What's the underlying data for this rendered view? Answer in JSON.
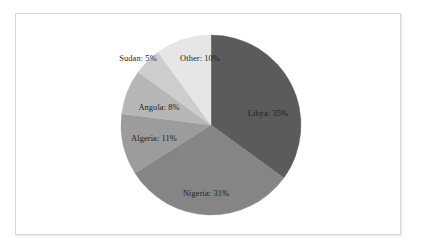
{
  "figure": {
    "background_color": "#ffffff",
    "frame_color": "#d8d8d8",
    "label_color": "#1d1d1d"
  },
  "chart_data": {
    "type": "pie",
    "title": "",
    "subtitle": "",
    "xlabel": "",
    "ylabel": "",
    "grid": false,
    "legend": "none",
    "label_format": "{name}: {value}%",
    "start_angle_deg": 90,
    "direction": "clockwise",
    "categories": [
      "Libya",
      "Nigeria",
      "Algeria",
      "Angola",
      "Sudan",
      "Other"
    ],
    "values": [
      35,
      31,
      11,
      8,
      5,
      10
    ],
    "units": "percent",
    "total": 100,
    "colors": [
      "#5b5b5b",
      "#858585",
      "#9c9c9c",
      "#b6b6b6",
      "#cdcdcd",
      "#e6e6e6"
    ],
    "slices": [
      {
        "name": "Libya",
        "value": 35,
        "label": "Libya: 35%",
        "color": "#5b5b5b",
        "start_deg": 0,
        "end_deg": 126,
        "label_x": 252,
        "label_y": 99
      },
      {
        "name": "Nigeria",
        "value": 31,
        "label": "Nigeria: 31%",
        "color": "#858585",
        "start_deg": 126,
        "end_deg": 237.6,
        "label_x": 190,
        "label_y": 179
      },
      {
        "name": "Algeria",
        "value": 11,
        "label": "Algeria: 11%",
        "color": "#9c9c9c",
        "start_deg": 237.6,
        "end_deg": 277.2,
        "label_x": 138,
        "label_y": 124
      },
      {
        "name": "Angola",
        "value": 8,
        "label": "Angola: 8%",
        "color": "#b6b6b6",
        "start_deg": 277.2,
        "end_deg": 306,
        "label_x": 143,
        "label_y": 93
      },
      {
        "name": "Sudan",
        "value": 5,
        "label": "Sudan: 5%",
        "color": "#cdcdcd",
        "start_deg": 306,
        "end_deg": 324,
        "label_x": 122,
        "label_y": 44
      },
      {
        "name": "Other",
        "value": 10,
        "label": "Other: 10%",
        "color": "#e6e6e6",
        "start_deg": 324,
        "end_deg": 360,
        "label_x": 184,
        "label_y": 44
      }
    ]
  }
}
